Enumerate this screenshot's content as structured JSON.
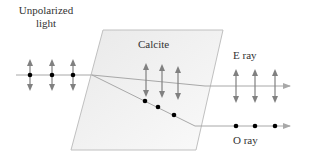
{
  "labels": {
    "incident_line1": "Unpolarized",
    "incident_line2": "light",
    "crystal": "Calcite",
    "e_ray": "E ray",
    "o_ray": "O ray"
  },
  "colors": {
    "crystal_fill": "#f2f2f2",
    "crystal_edge": "#c0c0c0",
    "ray": "#a8a8a8",
    "polarization_arrow": "#808080",
    "dot": "#000000",
    "text": "#333333"
  },
  "icons": {
    "vertical_polarization": "double-headed-vertical-arrow",
    "perpendicular_polarization": "dot"
  }
}
